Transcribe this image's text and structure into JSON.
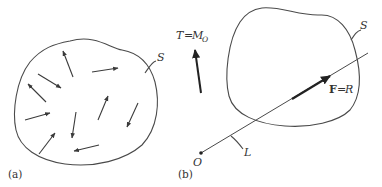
{
  "figure": {
    "type": "mechanics-diagram",
    "panels": [
      {
        "id": "a",
        "label": "(a)",
        "surface_label": "S",
        "description": "Closed region S with a distributed system of force vectors",
        "arrow_count": 10
      },
      {
        "id": "b",
        "label": "(b)",
        "surface_label": "S",
        "moment_label_left": "T",
        "moment_equals": "=",
        "moment_label_right": "M",
        "moment_subscript": "O",
        "force_label_left": "F",
        "force_equals": "=",
        "force_label_right": "R",
        "line_label": "L",
        "origin_label": "O"
      }
    ],
    "colors": {
      "stroke": "#4a4a4a",
      "text": "#333333",
      "background": "#ffffff"
    }
  }
}
